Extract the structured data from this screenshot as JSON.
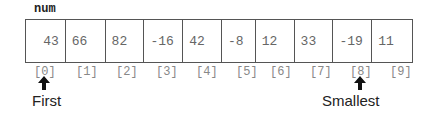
{
  "array": {
    "name": "num",
    "cells": [
      {
        "index": "[0]",
        "value": "43"
      },
      {
        "index": "[1]",
        "value": "66"
      },
      {
        "index": "[2]",
        "value": "82"
      },
      {
        "index": "[3]",
        "value": "-16"
      },
      {
        "index": "[4]",
        "value": "42"
      },
      {
        "index": "[5]",
        "value": "-8"
      },
      {
        "index": "[6]",
        "value": "12"
      },
      {
        "index": "[7]",
        "value": "33"
      },
      {
        "index": "[8]",
        "value": "-19"
      },
      {
        "index": "[9]",
        "value": "11"
      }
    ]
  },
  "pointers": [
    {
      "label": "First",
      "target_index": 0,
      "icon": "up-arrow-icon"
    },
    {
      "label": "Smallest",
      "target_index": 8,
      "icon": "up-arrow-icon"
    }
  ]
}
